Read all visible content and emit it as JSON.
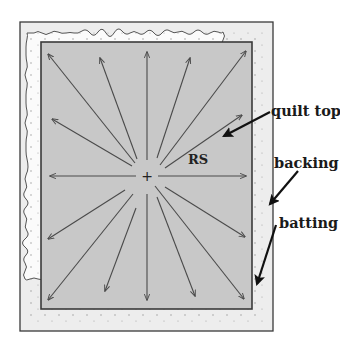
{
  "diagram": {
    "colors": {
      "background": "#ffffff",
      "backing_fill": "#ededed",
      "batting_fill": "#fbfbfb",
      "quilt_top_fill": "#c8c8c8",
      "outline": "#3a3a3a",
      "arrow": "#4a4a4a",
      "callout_arrow": "#111111"
    },
    "center_marker": "+",
    "right_side_label": "RS",
    "labels": [
      {
        "id": "quilt-top",
        "text": "quilt top"
      },
      {
        "id": "backing",
        "text": "backing"
      },
      {
        "id": "batting",
        "text": "batting"
      }
    ],
    "radiating_arrow_count": 16
  }
}
